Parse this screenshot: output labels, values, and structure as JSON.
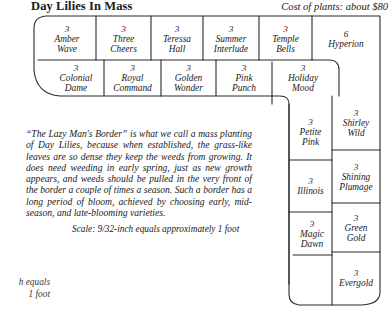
{
  "header": {
    "title": "Day Lilies In Mass",
    "cost_note": "Cost of plants: about $80"
  },
  "plan": {
    "row1": [
      {
        "qty": "3",
        "name": "Amber\nWave"
      },
      {
        "qty": "3",
        "name": "Three\nCheers"
      },
      {
        "qty": "3",
        "name": "Teressa\nHall"
      },
      {
        "qty": "3",
        "name": "Summer\nInterlude"
      },
      {
        "qty": "3",
        "name": "Temple\nBells"
      },
      {
        "qty": "6",
        "name": "Hyperion"
      }
    ],
    "row2": [
      {
        "qty": "3",
        "name": "Colonial\nDame"
      },
      {
        "qty": "3",
        "name": "Royal\nCommand"
      },
      {
        "qty": "3",
        "name": "Golden\nWonder"
      },
      {
        "qty": "3",
        "name": "Pink\nPunch"
      },
      {
        "qty": "3",
        "name": "Holiday\nMood"
      }
    ],
    "col_inner": [
      {
        "qty": "3",
        "name": "Petite\nPink"
      },
      {
        "qty": "3",
        "name": "Illinois"
      },
      {
        "qty": "3",
        "name": "Magic\nDawn"
      }
    ],
    "col_outer": [
      {
        "qty": "3",
        "name": "Shirley\nWild"
      },
      {
        "qty": "3",
        "name": "Shining\nPlumage"
      },
      {
        "qty": "3",
        "name": "Green\nGold"
      },
      {
        "qty": "3",
        "name": "Evergold"
      }
    ]
  },
  "notes": {
    "body": "“The Lazy Man's Border” is what we call a mass planting of Day Lilies, because when established, the grass-like leaves are so dense they keep the weeds from growing. It does need weeding in early spring, just as new growth appears, and weeds should be pulled in the very front of the border a couple of times a season. Such a border has a long period of bloom, achieved by choosing early, mid-season, and late-blooming varieties.",
    "scale": "Scale: 9/32-inch equals approximately 1 foot",
    "cutoff_caption": "h equals\n1 foot"
  },
  "style": {
    "line_color": "#2b2b2b",
    "background": "#ffffff"
  }
}
